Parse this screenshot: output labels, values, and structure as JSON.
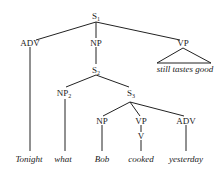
{
  "nodes": {
    "s1": {
      "label": "S",
      "sub": "1"
    },
    "adv1": {
      "label": "ADV"
    },
    "np1": {
      "label": "NP"
    },
    "vp1": {
      "label": "VP"
    },
    "s2": {
      "label": "S",
      "sub": "2"
    },
    "np2": {
      "label": "NP",
      "sub": "2"
    },
    "s3": {
      "label": "S",
      "sub": "3"
    },
    "np3": {
      "label": "NP"
    },
    "vp3": {
      "label": "VP"
    },
    "v3": {
      "label": "V"
    },
    "adv3": {
      "label": "ADV"
    }
  },
  "leaves": {
    "tonight": "Tonight",
    "what": "what",
    "bob": "Bob",
    "cooked": "cooked",
    "yesterday": "yesterday",
    "vp_triangle": "still tastes good"
  }
}
